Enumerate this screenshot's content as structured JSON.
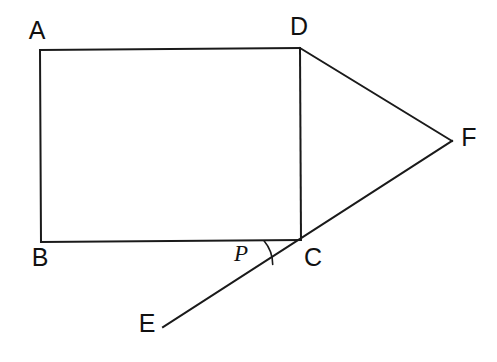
{
  "diagram": {
    "background_color": "#ffffff",
    "stroke_color": "#1a1a1a",
    "label_color": "#111111",
    "canvas": {
      "width": 497,
      "height": 362
    },
    "points": {
      "A": {
        "name": "A",
        "x": 40,
        "y": 50
      },
      "B": {
        "name": "B",
        "x": 41,
        "y": 242
      },
      "C": {
        "name": "C",
        "x": 301,
        "y": 240
      },
      "D": {
        "name": "D",
        "x": 300,
        "y": 48
      },
      "E": {
        "name": "E",
        "x": 163,
        "y": 327
      },
      "F": {
        "name": "F",
        "x": 452,
        "y": 141
      }
    },
    "labels": [
      {
        "id": "label-A",
        "text": "A",
        "x": 37,
        "y": 32,
        "style": "upright"
      },
      {
        "id": "label-D",
        "text": "D",
        "x": 299,
        "y": 28,
        "style": "upright"
      },
      {
        "id": "label-F",
        "text": "F",
        "x": 469,
        "y": 139,
        "style": "upright"
      },
      {
        "id": "label-B",
        "text": "B",
        "x": 40,
        "y": 259,
        "style": "upright"
      },
      {
        "id": "label-C",
        "text": "C",
        "x": 313,
        "y": 259,
        "style": "upright"
      },
      {
        "id": "label-E",
        "text": "E",
        "x": 147,
        "y": 325,
        "style": "upright"
      },
      {
        "id": "label-P",
        "text": "P",
        "x": 241,
        "y": 256,
        "style": "italic"
      }
    ],
    "edges": [
      {
        "id": "edge-AD",
        "from": "A",
        "to": "D",
        "path": "M 40 50 L 300 48"
      },
      {
        "id": "edge-AB",
        "from": "A",
        "to": "B",
        "path": "M 40 50 L 41 242"
      },
      {
        "id": "edge-BC",
        "from": "B",
        "to": "C",
        "path": "M 41 242 L 301 240"
      },
      {
        "id": "edge-DC",
        "from": "D",
        "to": "C",
        "path": "M 300 48 L 301 240"
      },
      {
        "id": "edge-DF",
        "from": "D",
        "to": "F",
        "path": "M 300 48 L 452 141"
      },
      {
        "id": "edge-ECF",
        "from": "E",
        "to": "F",
        "path": "M 163 327 L 452 141"
      }
    ],
    "angle_marks": [
      {
        "id": "angle-BCE",
        "vertex": "C",
        "label": "P",
        "radius": 37,
        "path": "M 264 240.8 A 37 37 0 0 1 272.7 264.4"
      }
    ]
  }
}
